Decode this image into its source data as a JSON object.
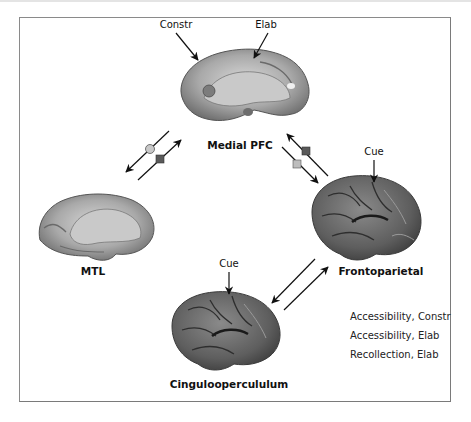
{
  "figure": {
    "regions": [
      {
        "id": "medial-pfc",
        "label": "Medial PFC",
        "view": "medial"
      },
      {
        "id": "mtl",
        "label": "MTL",
        "view": "medial"
      },
      {
        "id": "frontoparietal",
        "label": "Frontoparietal",
        "view": "lateral"
      },
      {
        "id": "cinguloopercululum",
        "label": "Cinguloopercululum",
        "view": "lateral"
      }
    ],
    "annotations": {
      "pfc_constr": "Constr",
      "pfc_elab": "Elab",
      "frontoparietal_cue": "Cue",
      "cingulo_cue": "Cue"
    },
    "connections": [
      {
        "from": "medial-pfc",
        "to": "mtl",
        "markers": [
          "circle-light"
        ]
      },
      {
        "from": "mtl",
        "to": "medial-pfc",
        "markers": [
          "square-dark"
        ]
      },
      {
        "from": "frontoparietal",
        "to": "medial-pfc",
        "markers": [
          "square-dark"
        ]
      },
      {
        "from": "medial-pfc",
        "to": "frontoparietal",
        "markers": [
          "square-light"
        ]
      },
      {
        "from": "frontoparietal",
        "to": "cinguloopercululum",
        "markers": []
      },
      {
        "from": "cinguloopercululum",
        "to": "frontoparietal",
        "markers": []
      }
    ],
    "legend": [
      "Accessibility, Constr",
      "Accessibility, Elab",
      "Recollection, Elab"
    ],
    "colors": {
      "marker_light": "#c8c8c8",
      "marker_dark": "#5a5a5a",
      "marker_square_light": "#bdbdbd",
      "arrow": "#111111",
      "frame": "#8a8a8a"
    }
  }
}
